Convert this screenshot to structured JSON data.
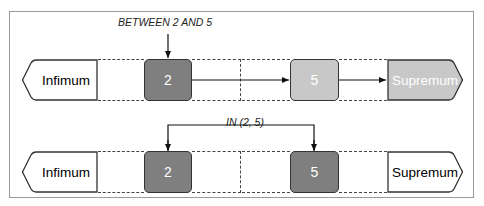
{
  "diagram": {
    "rows": [
      {
        "label": "BETWEEN 2 AND 5",
        "infimum": "Infimum",
        "supremum": "Supremum",
        "value_a": "2",
        "value_b": "5",
        "note": "Inclusive range: 2 (dark) marked, arrows run through 5 to Supremum (light shaded)"
      },
      {
        "label": "IN (2, 5)",
        "infimum": "Infimum",
        "supremum": "Supremum",
        "value_a": "2",
        "value_b": "5",
        "note": "Discrete set: only 2 and 5 marked (dark)"
      }
    ],
    "colors": {
      "dark_fill": "#7f7f7f",
      "light_fill": "#c8c8c8",
      "stroke": "#333333",
      "frame": "#9a9a9a"
    }
  }
}
